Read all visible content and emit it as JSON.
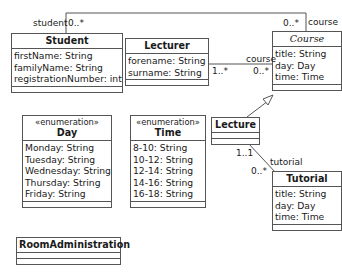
{
  "diagram": {
    "type": "UML class diagram",
    "classes": {
      "student": {
        "name": "Student",
        "attributes": [
          "firstName: String",
          "familyName: String",
          "registrationNumber: int"
        ]
      },
      "lecturer": {
        "name": "Lecturer",
        "attributes": [
          "forename: String",
          "surname: String"
        ]
      },
      "course": {
        "name": "Course",
        "abstract": true,
        "attributes": [
          "title: String",
          "day: Day",
          "time: Time"
        ]
      },
      "lecture": {
        "name": "Lecture",
        "attributes": []
      },
      "tutorial": {
        "name": "Tutorial",
        "attributes": [
          "title: String",
          "day: Day",
          "time: Time"
        ]
      },
      "day": {
        "stereotype": "«enumeration»",
        "name": "Day",
        "attributes": [
          "Monday: String",
          "Tuesday: String",
          "Wednesday: String",
          "Thursday: String",
          "Friday: String"
        ]
      },
      "time": {
        "stereotype": "«enumeration»",
        "name": "Time",
        "attributes": [
          "8-10: String",
          "10-12: String",
          "12-14: String",
          "14-16: String",
          "16-18: String"
        ]
      },
      "room_administration": {
        "name": "RoomAdministration",
        "attributes": []
      }
    },
    "associations": {
      "student_course": {
        "student_role": "student",
        "student_multiplicity": "0..*",
        "course_role": "course",
        "course_multiplicity": "0..*"
      },
      "lecturer_course": {
        "lecturer_multiplicity": "1..*",
        "course_role": "course",
        "course_multiplicity": "0..*"
      },
      "lecture_tutorial": {
        "lecture_multiplicity": "1..1",
        "tutorial_role": "tutorial",
        "tutorial_multiplicity": "0..*"
      }
    },
    "generalizations": [
      {
        "from": "Lecture",
        "to": "Course"
      }
    ],
    "colors": {
      "line": "#555555",
      "text": "#1a1a1a",
      "background": "#ffffff"
    }
  }
}
